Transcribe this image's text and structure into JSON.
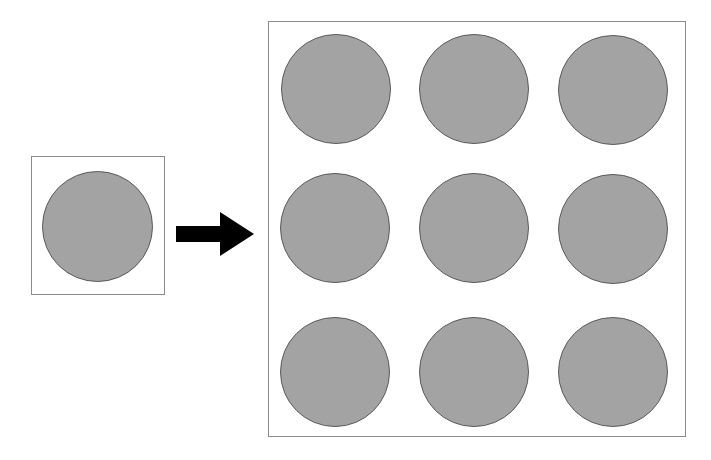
{
  "figure": {
    "background_color": "#ffffff",
    "width": 711,
    "height": 460
  },
  "style": {
    "disc_fill": "#a3a3a3",
    "disc_stroke": "#5a5a5a",
    "panel_stroke": "#8b8b8b",
    "arrow_fill": "#000000"
  },
  "unit_cell": {
    "label": "unit cell",
    "box": {
      "x": 31,
      "y": 156,
      "width": 134,
      "height": 139
    },
    "discs": [
      {
        "cx": 97,
        "cy": 226,
        "d": 111
      }
    ]
  },
  "arrow": {
    "label": "maps to",
    "direction": "right",
    "box": {
      "x": 176,
      "y": 210,
      "width": 78,
      "height": 48
    }
  },
  "tiled_grid": {
    "label": "3 by 3 tiling",
    "rows": 3,
    "cols": 3,
    "box": {
      "x": 268,
      "y": 21,
      "width": 418,
      "height": 416
    },
    "discs": [
      {
        "cx": 336,
        "cy": 89,
        "d": 110
      },
      {
        "cx": 474,
        "cy": 89,
        "d": 110
      },
      {
        "cx": 613,
        "cy": 90,
        "d": 110
      },
      {
        "cx": 335,
        "cy": 228,
        "d": 110
      },
      {
        "cx": 474,
        "cy": 228,
        "d": 110
      },
      {
        "cx": 613,
        "cy": 229,
        "d": 110
      },
      {
        "cx": 335,
        "cy": 372,
        "d": 110
      },
      {
        "cx": 474,
        "cy": 372,
        "d": 110
      },
      {
        "cx": 613,
        "cy": 372,
        "d": 110
      }
    ]
  }
}
